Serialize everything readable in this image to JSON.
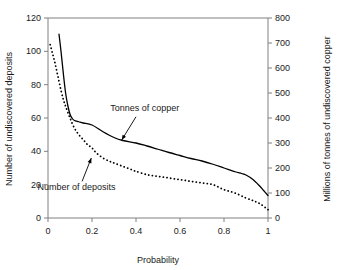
{
  "chart_data": {
    "type": "line",
    "title": "",
    "xlabel": "Probability",
    "ylabel": "Number of undiscovered deposits",
    "y2label": "Millions of tonnes of undiscovered copper",
    "xlim": [
      0,
      1
    ],
    "ylim": [
      0,
      120
    ],
    "y2lim": [
      0,
      800
    ],
    "xticks": [
      "0",
      "0.2",
      "0.4",
      "0.6",
      "0.8",
      "1"
    ],
    "xtick_values": [
      0,
      0.2,
      0.4,
      0.6,
      0.8,
      1
    ],
    "yticks": [
      "0",
      "20",
      "40",
      "60",
      "80",
      "100",
      "120"
    ],
    "ytick_values": [
      0,
      20,
      40,
      60,
      80,
      100,
      120
    ],
    "y2ticks": [
      "0",
      "100",
      "200",
      "300",
      "400",
      "500",
      "600",
      "700",
      "800"
    ],
    "y2tick_values": [
      0,
      100,
      200,
      300,
      400,
      500,
      600,
      700,
      800
    ],
    "grid": false,
    "legend": "annotations-inline",
    "series": [
      {
        "name": "Tonnes of copper",
        "axis": "right",
        "style": "solid",
        "color": "#000000",
        "x": [
          0.05,
          0.06,
          0.07,
          0.08,
          0.09,
          0.1,
          0.11,
          0.12,
          0.14,
          0.16,
          0.2,
          0.25,
          0.3,
          0.34,
          0.4,
          0.45,
          0.5,
          0.55,
          0.6,
          0.65,
          0.7,
          0.75,
          0.8,
          0.85,
          0.88,
          0.9,
          0.93,
          0.96,
          0.98,
          1.0
        ],
        "y": [
          735,
          660,
          575,
          500,
          450,
          415,
          398,
          390,
          385,
          380,
          372,
          345,
          322,
          310,
          300,
          288,
          275,
          262,
          250,
          238,
          228,
          215,
          200,
          185,
          178,
          172,
          155,
          130,
          110,
          90
        ]
      },
      {
        "name": "Number of deposits",
        "axis": "left",
        "style": "dotted",
        "color": "#000000",
        "x": [
          0.01,
          0.02,
          0.03,
          0.04,
          0.05,
          0.06,
          0.07,
          0.08,
          0.1,
          0.12,
          0.14,
          0.16,
          0.18,
          0.2,
          0.22,
          0.25,
          0.28,
          0.3,
          0.34,
          0.38,
          0.4,
          0.45,
          0.5,
          0.55,
          0.6,
          0.65,
          0.7,
          0.75,
          0.8,
          0.85,
          0.9,
          0.94,
          0.97,
          1.0
        ],
        "y": [
          104,
          99,
          94,
          88,
          82,
          76,
          71,
          67,
          60,
          54,
          50,
          47,
          44,
          42,
          39,
          36,
          34,
          33,
          31,
          29,
          28,
          26,
          25,
          24,
          23,
          22,
          21,
          20,
          17,
          15,
          12,
          10,
          8,
          5
        ]
      }
    ],
    "annotations": [
      {
        "text": "Tonnes of copper",
        "text_x": 0.44,
        "text_y_right": 430,
        "arrow_from_x": 0.4,
        "arrow_from_y_right": 405,
        "arrow_to_x": 0.335,
        "arrow_to_y_right": 312
      },
      {
        "text": "Number of deposits",
        "text_x": 0.13,
        "text_y_left": 17,
        "arrow_from_x": 0.155,
        "arrow_from_y_left": 22,
        "arrow_to_x": 0.197,
        "arrow_to_y_left": 36
      }
    ]
  },
  "figure": {
    "background_color": "#ffffff",
    "axis_color": "#808080",
    "curve_color": "#000000",
    "text_color": "#1a1a1a"
  }
}
